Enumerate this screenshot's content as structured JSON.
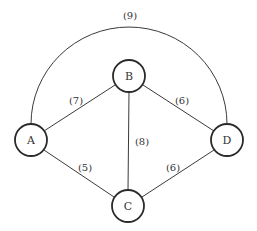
{
  "diagram": {
    "type": "weighted-undirected-graph",
    "nodes": [
      {
        "id": "A",
        "label": "A",
        "x": 31,
        "y": 140
      },
      {
        "id": "B",
        "label": "B",
        "x": 129,
        "y": 76
      },
      {
        "id": "C",
        "label": "C",
        "x": 128,
        "y": 206
      },
      {
        "id": "D",
        "label": "D",
        "x": 227,
        "y": 140
      }
    ],
    "edges": [
      {
        "from": "A",
        "to": "B",
        "weight": "(7)",
        "label_x": 76,
        "label_y": 100
      },
      {
        "from": "B",
        "to": "D",
        "weight": "(6)",
        "label_x": 182,
        "label_y": 100
      },
      {
        "from": "B",
        "to": "C",
        "weight": "(8)",
        "label_x": 142,
        "label_y": 141
      },
      {
        "from": "A",
        "to": "C",
        "weight": "(5)",
        "label_x": 85,
        "label_y": 167
      },
      {
        "from": "C",
        "to": "D",
        "weight": "(6)",
        "label_x": 173,
        "label_y": 167
      },
      {
        "from": "A",
        "to": "D",
        "weight": "(9)",
        "label_x": 130,
        "label_y": 15,
        "curved": true
      }
    ],
    "node_radius": 16,
    "colors": {
      "stroke": "#2a2a2a",
      "text": "#333333",
      "background": "#ffffff"
    }
  }
}
